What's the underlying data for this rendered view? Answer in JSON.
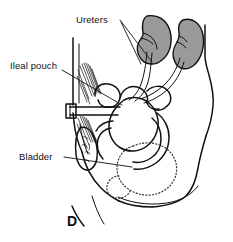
{
  "figure": {
    "panel_letter": "D",
    "caption_note": "",
    "colors": {
      "ink": "#111111",
      "kidney_fill": "#9a9a9a",
      "background": "#ffffff",
      "bladder_outline": "#333333"
    }
  },
  "labels": [
    {
      "id": "ureters",
      "text": "Ureters",
      "x": 76,
      "y": 23,
      "anchor": "start",
      "leaders": [
        {
          "x1": 120,
          "y1": 20,
          "x2": 152,
          "y2": 62
        },
        {
          "x1": 120,
          "y1": 21,
          "x2": 141,
          "y2": 63
        }
      ]
    },
    {
      "id": "ileal-pouch",
      "text": "Ileal pouch",
      "x": 10,
      "y": 69,
      "anchor": "start",
      "leaders": [
        {
          "x1": 62,
          "y1": 70,
          "x2": 122,
          "y2": 105
        }
      ]
    },
    {
      "id": "bladder",
      "text": "Bladder",
      "x": 19,
      "y": 160,
      "anchor": "start",
      "leaders": [
        {
          "x1": 64,
          "y1": 157,
          "x2": 132,
          "y2": 167
        }
      ]
    }
  ],
  "anatomy": [
    {
      "id": "left-kidney",
      "name": "Left kidney",
      "fill": "#9a9a9a"
    },
    {
      "id": "right-kidney",
      "name": "Right kidney",
      "fill": "#9a9a9a"
    },
    {
      "id": "ureter-left",
      "name": "Left ureter"
    },
    {
      "id": "ureter-right",
      "name": "Right ureter"
    },
    {
      "id": "ileal-pouch-reservoir",
      "name": "Ileal pouch reservoir"
    },
    {
      "id": "bowel-loops",
      "name": "Small bowel loops"
    },
    {
      "id": "stoma-conduit",
      "name": "Stoma conduit"
    },
    {
      "id": "abdominal-wall",
      "name": "Abdominal wall with muscle hatching"
    },
    {
      "id": "bladder-outline",
      "name": "Bladder (dotted outline)"
    },
    {
      "id": "torso-outline",
      "name": "Torso outline, lateral view"
    }
  ]
}
